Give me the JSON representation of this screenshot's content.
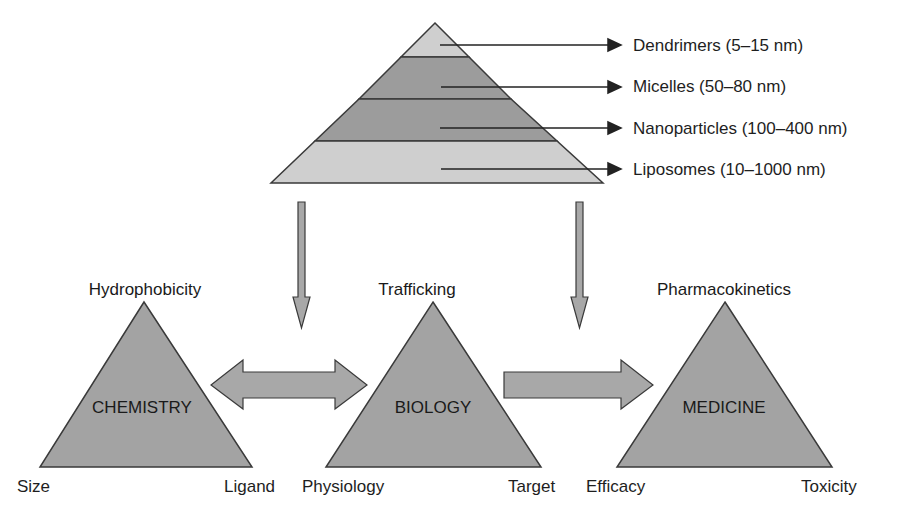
{
  "pyramid": {
    "layers": [
      {
        "label": "Dendrimers (5–15 nm)",
        "fill": "#cfcfcf"
      },
      {
        "label": "Micelles (50–80 nm)",
        "fill": "#9c9c9c"
      },
      {
        "label": "Nanoparticles (100–400 nm)",
        "fill": "#9c9c9c"
      },
      {
        "label": "Liposomes (10–1000 nm)",
        "fill": "#cfcfcf"
      }
    ]
  },
  "triangles": [
    {
      "name": "CHEMISTRY",
      "top": "Hydrophobicity",
      "left": "Size",
      "right": "Ligand"
    },
    {
      "name": "BIOLOGY",
      "top": "Trafficking",
      "left": "Physiology",
      "right": "Target"
    },
    {
      "name": "MEDICINE",
      "top": "Pharmacokinetics",
      "left": "Efficacy",
      "right": "Toxicity"
    }
  ],
  "colors": {
    "triangle_fill": "#a3a3a3",
    "arrow_fill": "#a8a8a8",
    "stroke": "#3a3a3a",
    "text": "#1e1e1e"
  }
}
